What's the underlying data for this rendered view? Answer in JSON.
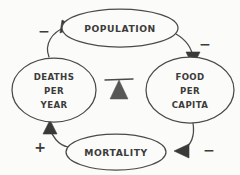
{
  "diagram": {
    "type": "causal-loop-diagram",
    "background_color": "#fbfbfa",
    "ink_color": "#4a4a48",
    "nodes": [
      {
        "id": "population",
        "label": "POPULATION",
        "lines": [
          "POPULATION"
        ],
        "position": "top",
        "cx": 120,
        "cy": 28,
        "rx": 58,
        "ry": 19
      },
      {
        "id": "food-per-capita",
        "label": "FOOD PER CAPITA",
        "lines": [
          "FOOD",
          "PER",
          "CAPITA"
        ],
        "position": "right",
        "cx": 190,
        "cy": 90,
        "rx": 44,
        "ry": 33
      },
      {
        "id": "mortality",
        "label": "MORTALITY",
        "lines": [
          "MORTALITY"
        ],
        "position": "bottom",
        "cx": 116,
        "cy": 152,
        "rx": 50,
        "ry": 18
      },
      {
        "id": "deaths-per-year",
        "label": "DEATHS PER YEAR",
        "lines": [
          "DEATHS",
          "PER",
          "YEAR"
        ],
        "position": "left",
        "cx": 54,
        "cy": 90,
        "rx": 42,
        "ry": 32
      }
    ],
    "links": [
      {
        "id": "population-to-food",
        "from": "population",
        "to": "food-per-capita",
        "polarity": "−",
        "polarity_name": "minus",
        "label_x": 205,
        "label_y": 45
      },
      {
        "id": "food-to-mortality",
        "from": "food-per-capita",
        "to": "mortality",
        "polarity": "−",
        "polarity_name": "minus",
        "label_x": 210,
        "label_y": 152
      },
      {
        "id": "mortality-to-deaths",
        "from": "mortality",
        "to": "deaths-per-year",
        "polarity": "+",
        "polarity_name": "plus",
        "label_x": 40,
        "label_y": 148
      },
      {
        "id": "deaths-to-population",
        "from": "deaths-per-year",
        "to": "population",
        "polarity": "−",
        "polarity_name": "minus",
        "label_x": 44,
        "label_y": 32
      }
    ],
    "center_symbol": {
      "id": "balance-fulcrum",
      "name": "balancing-loop-fulcrum-icon",
      "description": "balance bar on triangular pedestal"
    }
  }
}
